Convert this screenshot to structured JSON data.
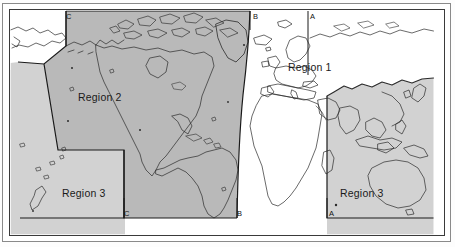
{
  "figure": {
    "type": "world-map-region-diagram",
    "title": ""
  },
  "colors": {
    "region2_fill": "#b9b9b9",
    "region3_fill": "#d2d2d2",
    "region1_fill": "#ffffff",
    "coastline": "#2b2b2b",
    "boundary_line": "#1a1a1a",
    "frame_outer": "#8a8a8a",
    "frame_inner": "#3a3a3a",
    "label_text": "#1a1a1a"
  },
  "regions": [
    {
      "id": "region-1",
      "label": "Region 1",
      "x": 288,
      "y": 61,
      "shading": "unshaded"
    },
    {
      "id": "region-2",
      "label": "Region 2",
      "x": 78,
      "y": 91,
      "shading": "dark"
    },
    {
      "id": "region-3-left",
      "label": "Region 3",
      "x": 62,
      "y": 187,
      "shading": "light"
    },
    {
      "id": "region-3-right",
      "label": "Region 3",
      "x": 340,
      "y": 187,
      "shading": "light"
    }
  ],
  "boundary_markers": [
    {
      "id": "marker-c-top",
      "label": "C",
      "x": 66,
      "y": 12
    },
    {
      "id": "marker-b-top",
      "label": "B",
      "x": 253,
      "y": 12
    },
    {
      "id": "marker-a-top",
      "label": "A",
      "x": 310,
      "y": 12
    },
    {
      "id": "marker-c-bottom",
      "label": "C",
      "x": 124,
      "y": 219
    },
    {
      "id": "marker-b-bottom",
      "label": "B",
      "x": 237,
      "y": 219
    },
    {
      "id": "marker-a-bottom",
      "label": "A",
      "x": 329,
      "y": 219
    }
  ],
  "boundary_lines": [
    {
      "id": "line-c",
      "label": "C",
      "orientation": "vertical-segmented"
    },
    {
      "id": "line-b",
      "label": "B",
      "orientation": "vertical-segmented"
    },
    {
      "id": "line-a",
      "label": "A",
      "orientation": "vertical-segmented"
    }
  ]
}
